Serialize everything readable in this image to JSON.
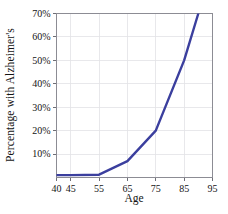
{
  "chart_data": {
    "type": "line",
    "title": "",
    "xlabel": "Age",
    "ylabel": "Percentage with Alzheimer's",
    "xlim": [
      40,
      95
    ],
    "ylim": [
      0,
      70
    ],
    "grid": true,
    "legend": null,
    "xticks": [
      40,
      45,
      55,
      65,
      75,
      85,
      95
    ],
    "xticklabels": [
      "40",
      "45",
      "55",
      "65",
      "75",
      "85",
      "95"
    ],
    "yticks": [
      10,
      20,
      30,
      40,
      50,
      60,
      70
    ],
    "yticklabels": [
      "10%",
      "20%",
      "30%",
      "40%",
      "50%",
      "60%",
      "70%"
    ],
    "series": [
      {
        "name": "Percentage with Alzheimer's",
        "color": "#3b3f9e",
        "x": [
          40,
          45,
          55,
          65,
          75,
          85,
          90
        ],
        "values": [
          1,
          1,
          1.2,
          7,
          20,
          50,
          70
        ]
      }
    ]
  }
}
